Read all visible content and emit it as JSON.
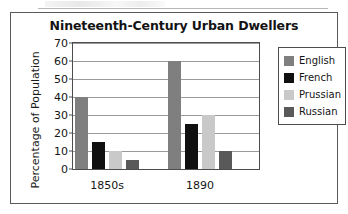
{
  "chart_data": {
    "type": "bar",
    "title": "Nineteenth-Century Urban Dwellers",
    "xlabel": "",
    "ylabel": "Percentage of Population",
    "categories": [
      "1850s",
      "1890"
    ],
    "series": [
      {
        "name": "English",
        "values": [
          40,
          60
        ],
        "color": "#7f7f7f"
      },
      {
        "name": "French",
        "values": [
          15,
          25
        ],
        "color": "#101010"
      },
      {
        "name": "Prussian",
        "values": [
          10,
          30
        ],
        "color": "#c9c9c9"
      },
      {
        "name": "Russian",
        "values": [
          5,
          10
        ],
        "color": "#595959"
      }
    ],
    "ylim": [
      0,
      70
    ],
    "ytick_step": 10,
    "yticks": [
      "70",
      "60",
      "50",
      "40",
      "30",
      "20",
      "10",
      "0"
    ],
    "grid": true,
    "legend_position": "right"
  },
  "legend": {
    "items": [
      {
        "label": "English"
      },
      {
        "label": "French"
      },
      {
        "label": "Prussian"
      },
      {
        "label": "Russian"
      }
    ]
  }
}
